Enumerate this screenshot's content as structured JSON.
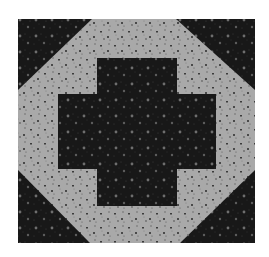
{
  "image": {
    "subject": "quilt-block",
    "description": "Square patchwork quilt block: dark calico corner triangles, light calico octagonal field, dark calico plus/cross in the center",
    "canvas": {
      "width": 269,
      "height": 257,
      "background": "#ffffff"
    },
    "block": {
      "x": 18,
      "y": 19,
      "right": 255,
      "bottom": 243
    },
    "colors": {
      "dark_fabric": "#181818",
      "dark_fabric_dot": "#6e6e6e",
      "dark_fabric_speck": "#3a3a3a",
      "light_fabric": "#a9a9a9",
      "light_fabric_speck": "#3c3c3c",
      "light_fabric_speck2": "#6a6a6a"
    },
    "corner_triangles": [
      {
        "name": "top-left",
        "points": [
          [
            18,
            19
          ],
          [
            92,
            19
          ],
          [
            18,
            90
          ]
        ]
      },
      {
        "name": "top-right",
        "points": [
          [
            176,
            19
          ],
          [
            255,
            19
          ],
          [
            255,
            90
          ]
        ]
      },
      {
        "name": "bottom-left",
        "points": [
          [
            18,
            170
          ],
          [
            18,
            243
          ],
          [
            90,
            243
          ]
        ]
      },
      {
        "name": "bottom-right",
        "points": [
          [
            255,
            170
          ],
          [
            255,
            243
          ],
          [
            180,
            243
          ]
        ]
      }
    ],
    "cross": {
      "vertical_arm": {
        "x": 97,
        "y": 58,
        "w": 80,
        "h": 148
      },
      "horizontal_arm": {
        "x": 58,
        "y": 94,
        "w": 158,
        "h": 75
      }
    }
  }
}
